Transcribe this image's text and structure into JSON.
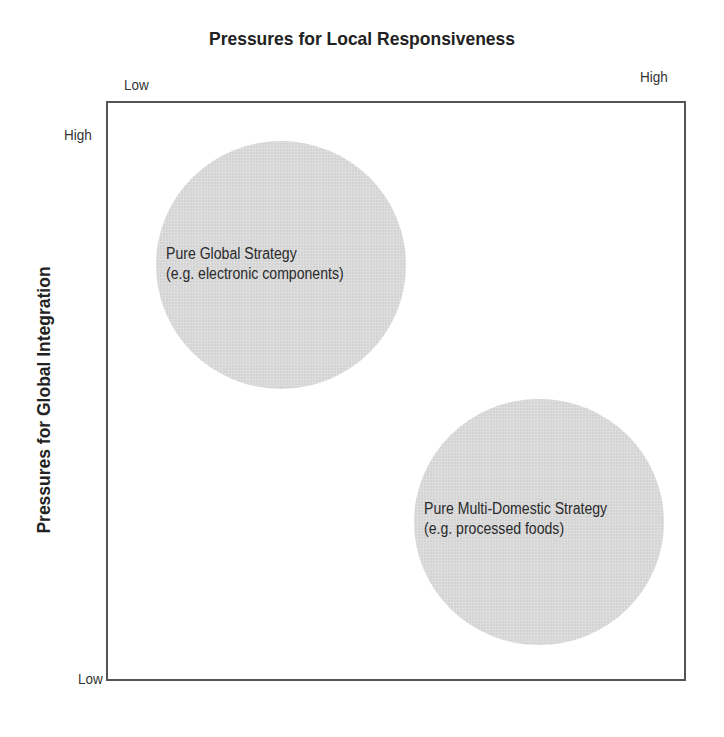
{
  "diagram": {
    "title": "Pressures for Local Responsiveness",
    "x_axis": {
      "label": "Pressures for Local Responsiveness",
      "low_label": "Low",
      "high_label": "High"
    },
    "y_axis": {
      "label": "Pressures for Global Integration",
      "high_label": "High",
      "low_label": "Low"
    },
    "regions": [
      {
        "name": "Pure Global Strategy",
        "line1": "Pure Global Strategy",
        "line2": "(e.g. electronic components)",
        "color": "#d4d4d4",
        "position": "high global integration, low local responsiveness"
      },
      {
        "name": "Pure Multi-Domestic Strategy",
        "line1": "Pure Multi-Domestic Strategy",
        "line2": "(e.g. processed foods)",
        "color": "#d4d4d4",
        "position": "low global integration, high local responsiveness"
      }
    ],
    "frame_color": "#555555"
  }
}
